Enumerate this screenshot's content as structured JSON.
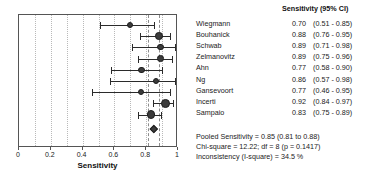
{
  "chart_data": {
    "type": "forest",
    "title": "",
    "xlabel": "Sensitivity",
    "ylabel": "",
    "xlim": [
      0,
      1
    ],
    "grid": true,
    "x_ticks": [
      {
        "value": 0,
        "label": "0"
      },
      {
        "value": 0.2,
        "label": "0.2"
      },
      {
        "value": 0.4,
        "label": "0.4"
      },
      {
        "value": 0.6,
        "label": "0.6"
      },
      {
        "value": 0.8,
        "label": "0.8"
      },
      {
        "value": 1,
        "label": "1"
      }
    ],
    "gridlines": [
      0.1,
      0.2,
      0.3,
      0.4,
      0.5,
      0.6,
      0.7,
      0.8,
      0.9
    ],
    "column_header": "Sensitivity (95% CI)",
    "studies": [
      {
        "name": "Wiegmann",
        "estimate": 0.7,
        "ci_low": 0.51,
        "ci_high": 0.85,
        "estimate_label": "0.70",
        "ci_label": "(0.51 - 0.85)",
        "weight": 0.45
      },
      {
        "name": "Bouhanick",
        "estimate": 0.88,
        "ci_low": 0.76,
        "ci_high": 0.95,
        "estimate_label": "0.88",
        "ci_label": "(0.76 - 0.95)",
        "weight": 0.72
      },
      {
        "name": "Schwab",
        "estimate": 0.89,
        "ci_low": 0.71,
        "ci_high": 0.98,
        "estimate_label": "0.89",
        "ci_label": "(0.71 - 0.98)",
        "weight": 0.42
      },
      {
        "name": "Zelmanovitz",
        "estimate": 0.89,
        "ci_low": 0.75,
        "ci_high": 0.96,
        "estimate_label": "0.89",
        "ci_label": "(0.75 - 0.96)",
        "weight": 0.52
      },
      {
        "name": "Ahn",
        "estimate": 0.77,
        "ci_low": 0.58,
        "ci_high": 0.9,
        "estimate_label": "0.77",
        "ci_label": "(0.58 - 0.90)",
        "weight": 0.46
      },
      {
        "name": "Ng",
        "estimate": 0.86,
        "ci_low": 0.57,
        "ci_high": 0.98,
        "estimate_label": "0.86",
        "ci_label": "(0.57 - 0.98)",
        "weight": 0.4
      },
      {
        "name": "Gansevoort",
        "estimate": 0.77,
        "ci_low": 0.46,
        "ci_high": 0.95,
        "estimate_label": "0.77",
        "ci_label": "(0.46 - 0.95)",
        "weight": 0.38
      },
      {
        "name": "Incerti",
        "estimate": 0.92,
        "ci_low": 0.84,
        "ci_high": 0.97,
        "estimate_label": "0.92",
        "ci_label": "(0.84 - 0.97)",
        "weight": 1.0
      },
      {
        "name": "Sampaio",
        "estimate": 0.83,
        "ci_low": 0.75,
        "ci_high": 0.89,
        "estimate_label": "0.83",
        "ci_label": "(0.75 - 0.89)",
        "weight": 0.92
      }
    ],
    "pooled": {
      "estimate": 0.85,
      "ci_low": 0.81,
      "ci_high": 0.88
    }
  },
  "summary": {
    "pooled_line": "Pooled Sensitivity = 0.85 (0.81 to 0.88)",
    "chisquare_line": "Chi-square = 12.22; df = 8 (p = 0.1417)",
    "inconsistency_line": "Inconsistency (I-square) = 34.5 %"
  }
}
